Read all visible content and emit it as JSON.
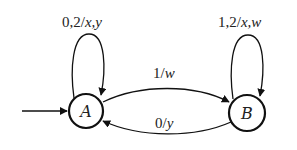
{
  "diagram": {
    "type": "finite-state-machine",
    "initial_state": "A",
    "states": [
      {
        "id": "A",
        "label": "A"
      },
      {
        "id": "B",
        "label": "B"
      }
    ],
    "transitions": [
      {
        "from": "A",
        "to": "A",
        "input": "0,2",
        "output": "x,y",
        "label": "0,2/x,y"
      },
      {
        "from": "B",
        "to": "B",
        "input": "1,2",
        "output": "x,w",
        "label": "1,2/x,w"
      },
      {
        "from": "A",
        "to": "B",
        "input": "1",
        "output": "w",
        "label": "1/w"
      },
      {
        "from": "B",
        "to": "A",
        "input": "0",
        "output": "y",
        "label": "0/y"
      }
    ],
    "labels": {
      "loopA_input": "0,2/",
      "loopA_output": "x,y",
      "loopB_input": "1,2/",
      "loopB_output": "x,w",
      "ab_input": "1/",
      "ab_output": "w",
      "ba_input": "0/",
      "ba_output": "y"
    }
  }
}
